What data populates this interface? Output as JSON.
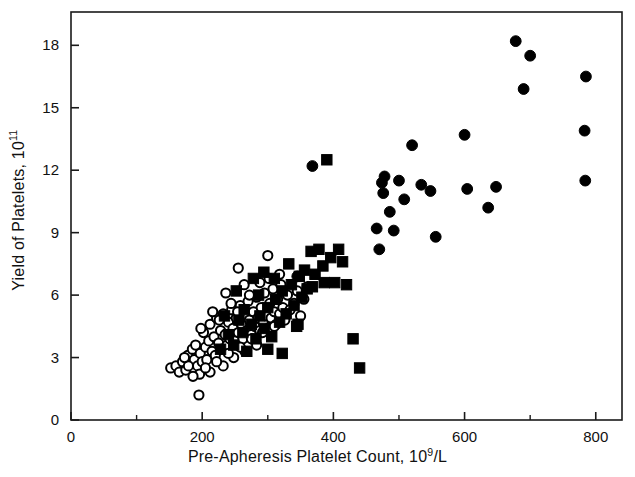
{
  "chart_data": {
    "type": "scatter",
    "title": "",
    "xlabel_prefix": "Pre-Apheresis Platelet Count, 10",
    "xlabel_sup": "9",
    "xlabel_suffix": "/L",
    "ylabel_prefix": "Yield of Platelets, 10",
    "ylabel_sup": "11",
    "ylabel_suffix": "",
    "xlim": [
      0,
      840
    ],
    "ylim": [
      0,
      19.6
    ],
    "xticks": [
      0,
      200,
      400,
      600,
      800
    ],
    "yticks": [
      0,
      3,
      6,
      9,
      12,
      15,
      18
    ],
    "xticklabels": [
      "0",
      "200",
      "400",
      "600",
      "800"
    ],
    "yticklabels": [
      "0",
      "3",
      "6",
      "9",
      "12",
      "15",
      "18"
    ],
    "xminorticks": [
      100,
      300,
      500,
      700
    ],
    "grid": false,
    "legend": false,
    "frame": "box",
    "marker_colors": {
      "open": "#ffffff",
      "fill": "#000000",
      "edge": "#000000"
    },
    "series": [
      {
        "name": "open-circle",
        "marker": "circle-open",
        "points": [
          [
            152,
            2.5
          ],
          [
            160,
            2.6
          ],
          [
            165,
            2.3
          ],
          [
            170,
            2.8
          ],
          [
            175,
            2.4
          ],
          [
            178,
            3.1
          ],
          [
            182,
            2.7
          ],
          [
            185,
            3.4
          ],
          [
            188,
            2.9
          ],
          [
            190,
            3.6
          ],
          [
            193,
            2.6
          ],
          [
            195,
            1.2
          ],
          [
            197,
            3.2
          ],
          [
            200,
            2.8
          ],
          [
            202,
            4.2
          ],
          [
            205,
            3.5
          ],
          [
            207,
            2.9
          ],
          [
            210,
            3.8
          ],
          [
            212,
            4.6
          ],
          [
            215,
            3.3
          ],
          [
            218,
            4.0
          ],
          [
            220,
            3.1
          ],
          [
            222,
            4.9
          ],
          [
            225,
            3.7
          ],
          [
            228,
            4.3
          ],
          [
            230,
            3.4
          ],
          [
            232,
            5.1
          ],
          [
            235,
            4.1
          ],
          [
            238,
            3.6
          ],
          [
            240,
            4.7
          ],
          [
            242,
            3.9
          ],
          [
            245,
            5.3
          ],
          [
            247,
            4.4
          ],
          [
            250,
            3.8
          ],
          [
            252,
            4.9
          ],
          [
            255,
            4.2
          ],
          [
            258,
            5.5
          ],
          [
            260,
            4.6
          ],
          [
            262,
            3.9
          ],
          [
            265,
            5.0
          ],
          [
            268,
            4.3
          ],
          [
            270,
            5.7
          ],
          [
            272,
            4.8
          ],
          [
            275,
            4.1
          ],
          [
            278,
            5.2
          ],
          [
            280,
            4.5
          ],
          [
            283,
            5.9
          ],
          [
            285,
            4.9
          ],
          [
            288,
            4.3
          ],
          [
            290,
            5.4
          ],
          [
            293,
            4.7
          ],
          [
            295,
            6.1
          ],
          [
            298,
            5.0
          ],
          [
            300,
            4.4
          ],
          [
            303,
            5.6
          ],
          [
            305,
            4.9
          ],
          [
            308,
            6.3
          ],
          [
            310,
            5.2
          ],
          [
            313,
            4.6
          ],
          [
            315,
            5.8
          ],
          [
            318,
            5.1
          ],
          [
            320,
            6.5
          ],
          [
            323,
            5.4
          ],
          [
            326,
            4.8
          ],
          [
            330,
            6.0
          ],
          [
            334,
            5.3
          ],
          [
            255,
            7.3
          ],
          [
            300,
            7.9
          ],
          [
            340,
            5.6
          ],
          [
            345,
            6.2
          ],
          [
            350,
            5.0
          ],
          [
            355,
            5.8
          ],
          [
            360,
            6.4
          ],
          [
            212,
            2.3
          ],
          [
            196,
            2.2
          ],
          [
            232,
            2.6
          ],
          [
            205,
            2.5
          ],
          [
            248,
            3.0
          ],
          [
            265,
            3.3
          ],
          [
            283,
            3.6
          ],
          [
            222,
            2.8
          ],
          [
            240,
            3.2
          ],
          [
            258,
            3.5
          ],
          [
            275,
            3.9
          ],
          [
            292,
            4.2
          ],
          [
            310,
            4.5
          ],
          [
            186,
            2.1
          ],
          [
            179,
            2.6
          ],
          [
            173,
            3.0
          ],
          [
            216,
            5.2
          ],
          [
            244,
            5.6
          ],
          [
            272,
            6.0
          ],
          [
            198,
            4.4
          ],
          [
            226,
            4.8
          ],
          [
            254,
            5.2
          ],
          [
            288,
            6.6
          ],
          [
            302,
            6.8
          ],
          [
            318,
            7.0
          ],
          [
            236,
            6.1
          ],
          [
            264,
            6.5
          ]
        ]
      },
      {
        "name": "filled-square",
        "marker": "square-filled",
        "points": [
          [
            228,
            3.4
          ],
          [
            248,
            3.6
          ],
          [
            262,
            4.2
          ],
          [
            268,
            3.3
          ],
          [
            275,
            4.6
          ],
          [
            282,
            3.9
          ],
          [
            288,
            5.0
          ],
          [
            295,
            4.4
          ],
          [
            300,
            5.4
          ],
          [
            306,
            4.0
          ],
          [
            312,
            5.8
          ],
          [
            318,
            4.7
          ],
          [
            322,
            6.2
          ],
          [
            328,
            5.1
          ],
          [
            332,
            7.5
          ],
          [
            336,
            6.5
          ],
          [
            340,
            5.5
          ],
          [
            344,
            4.5
          ],
          [
            348,
            6.9
          ],
          [
            352,
            5.9
          ],
          [
            356,
            7.2
          ],
          [
            360,
            6.3
          ],
          [
            366,
            8.1
          ],
          [
            372,
            7.0
          ],
          [
            378,
            8.2
          ],
          [
            384,
            7.4
          ],
          [
            390,
            12.5
          ],
          [
            396,
            7.8
          ],
          [
            402,
            6.6
          ],
          [
            408,
            8.2
          ],
          [
            414,
            7.6
          ],
          [
            300,
            3.4
          ],
          [
            322,
            3.2
          ],
          [
            346,
            4.6
          ],
          [
            430,
            3.9
          ],
          [
            440,
            2.5
          ],
          [
            286,
            6.0
          ],
          [
            264,
            5.3
          ],
          [
            256,
            4.8
          ],
          [
            240,
            4.1
          ],
          [
            234,
            5.0
          ],
          [
            310,
            6.8
          ],
          [
            368,
            6.4
          ],
          [
            386,
            6.6
          ],
          [
            420,
            6.5
          ],
          [
            252,
            6.2
          ],
          [
            278,
            6.8
          ],
          [
            294,
            7.1
          ]
        ]
      },
      {
        "name": "filled-circle",
        "marker": "circle-filled",
        "points": [
          [
            345,
            6.9
          ],
          [
            368,
            12.2
          ],
          [
            466,
            9.2
          ],
          [
            470,
            8.2
          ],
          [
            474,
            11.4
          ],
          [
            476,
            10.9
          ],
          [
            478,
            11.7
          ],
          [
            486,
            10.0
          ],
          [
            492,
            9.1
          ],
          [
            500,
            11.5
          ],
          [
            508,
            10.6
          ],
          [
            520,
            13.2
          ],
          [
            534,
            11.3
          ],
          [
            548,
            11.0
          ],
          [
            556,
            8.8
          ],
          [
            600,
            13.7
          ],
          [
            604,
            11.1
          ],
          [
            636,
            10.2
          ],
          [
            648,
            11.2
          ],
          [
            678,
            18.2
          ],
          [
            700,
            17.5
          ],
          [
            690,
            15.9
          ],
          [
            785,
            16.5
          ],
          [
            783,
            13.9
          ],
          [
            784,
            11.5
          ]
        ]
      }
    ]
  }
}
